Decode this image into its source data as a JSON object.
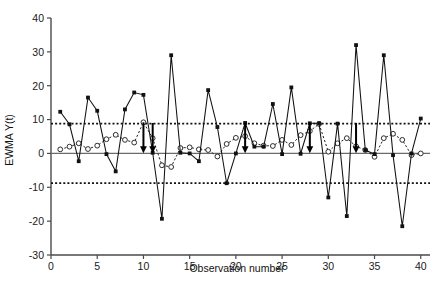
{
  "chart_data": {
    "type": "line",
    "title": "",
    "xlabel": "Observation number",
    "ylabel": "EWMA Y(t)",
    "xlim": [
      0,
      41
    ],
    "ylim": [
      -30,
      40
    ],
    "xticks": [
      0,
      5,
      10,
      15,
      20,
      25,
      30,
      35,
      40
    ],
    "xtick_labels": [
      "0",
      "5",
      "10",
      "15",
      "20",
      "25",
      "30",
      "35",
      "40"
    ],
    "yticks": [
      -30,
      -20,
      -10,
      0,
      10,
      20,
      30,
      40
    ],
    "ytick_labels": [
      "-30",
      "-20",
      "-10",
      "0",
      "10",
      "20",
      "30",
      "40"
    ],
    "grid": false,
    "legend_position": "upper-left-inside",
    "x": [
      1,
      2,
      3,
      4,
      5,
      6,
      7,
      8,
      9,
      10,
      11,
      12,
      13,
      14,
      15,
      16,
      17,
      18,
      19,
      20,
      21,
      22,
      23,
      24,
      25,
      26,
      27,
      28,
      29,
      30,
      31,
      32,
      33,
      34,
      35,
      36,
      37,
      38,
      39,
      40
    ],
    "series": [
      {
        "name": "EWMA",
        "marker": "open-circle",
        "line": "dotted",
        "color": "#222222",
        "values": [
          1.2,
          2.0,
          3.0,
          1.3,
          2.3,
          4.2,
          5.5,
          4.0,
          3.2,
          9.2,
          4.5,
          -3.5,
          -4.0,
          1.6,
          1.8,
          1.2,
          1.0,
          -0.9,
          2.8,
          4.6,
          5.1,
          3.0,
          2.3,
          2.2,
          4.0,
          2.5,
          5.4,
          6.6,
          8.7,
          0.5,
          3.0,
          4.5,
          2.1,
          1.0,
          -1.0,
          4.5,
          5.8,
          4.0,
          -0.5,
          0.0
        ]
      },
      {
        "name": "Y(t)",
        "marker": "filled-square",
        "line": "solid",
        "color": "#111111",
        "values": [
          12.3,
          8.6,
          -2.3,
          16.5,
          12.6,
          -0.2,
          -5.3,
          13.0,
          18.0,
          17.3,
          0.2,
          -19.3,
          29.0,
          0.2,
          0.0,
          -2.3,
          18.7,
          7.8,
          -8.8,
          0.0,
          9.0,
          2.0,
          2.0,
          14.6,
          -0.2,
          19.5,
          -0.1,
          8.9,
          8.9,
          -13.0,
          8.8,
          -18.5,
          32.0,
          1.0,
          -0.2,
          29.0,
          -0.5,
          -21.5,
          0.0,
          10.3
        ]
      }
    ],
    "reference_lines": [
      {
        "name": "upper-control-limit",
        "value": 8.8,
        "style": "dotted"
      },
      {
        "name": "center-line",
        "value": 0,
        "style": "solid"
      },
      {
        "name": "lower-control-limit",
        "value": -8.8,
        "style": "dotted"
      }
    ],
    "annotations": [
      {
        "name": "out-of-control-arrow",
        "x": 10,
        "y_from": 9.2,
        "y_to": 0.5
      },
      {
        "name": "out-of-control-arrow",
        "x": 11,
        "y_from": 9.0,
        "y_to": 0.5
      },
      {
        "name": "out-of-control-arrow",
        "x": 21,
        "y_from": 9.0,
        "y_to": 0.5
      },
      {
        "name": "out-of-control-arrow",
        "x": 28,
        "y_from": 9.0,
        "y_to": 0.5
      },
      {
        "name": "out-of-control-arrow",
        "x": 33,
        "y_from": 9.0,
        "y_to": 0.5
      }
    ]
  },
  "axes": {
    "x_title": "Observation number",
    "y_title": "EWMA Y(t)"
  },
  "legend": {
    "items": [
      {
        "label": "EWMA",
        "style": "dotted-open-circle"
      },
      {
        "label": "Y(t)",
        "style": "solid-filled-square"
      }
    ],
    "ewma_label": "EWMA",
    "yt_label": "Y(t)"
  }
}
